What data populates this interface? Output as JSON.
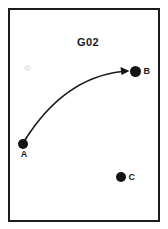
{
  "diagram": {
    "title": "G02",
    "points": [
      {
        "id": "A",
        "label": "A",
        "position": "lower-left"
      },
      {
        "id": "B",
        "label": "B",
        "position": "upper-right"
      },
      {
        "id": "C",
        "label": "C",
        "position": "lower-right"
      }
    ],
    "arrow": {
      "from": "A",
      "to": "B",
      "style": "curved-solid-arrowhead"
    },
    "colors": {
      "ink": "#1a1a1a",
      "background": "#ffffff"
    }
  }
}
